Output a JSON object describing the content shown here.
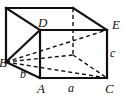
{
  "figure": {
    "type": "geometry-diagram",
    "shape_name": "rectangular-box",
    "width": 125,
    "height": 101,
    "background_color": "#ffffff",
    "stroke_color": "#111111",
    "solid_edge_width": 2.2,
    "hidden_edge_width": 1.4,
    "hidden_edge_dash": "4 3"
  },
  "vertices": {
    "A": {
      "label": "A",
      "x": 40,
      "y": 78,
      "label_x": 37,
      "label_y": 82,
      "hidden": false
    },
    "B": {
      "label": "B",
      "x": 6,
      "y": 62,
      "label_x": -1,
      "label_y": 56,
      "hidden": false
    },
    "C": {
      "label": "C",
      "x": 107,
      "y": 78,
      "label_x": 105,
      "label_y": 82,
      "hidden": false
    },
    "D": {
      "label": "D",
      "x": 40,
      "y": 30,
      "label_x": 38,
      "label_y": 16,
      "hidden": false
    },
    "E": {
      "label": "E",
      "x": 107,
      "y": 30,
      "label_x": 112,
      "label_y": 18,
      "hidden": false
    },
    "F_back_top_left": {
      "label": "",
      "x": 6,
      "y": 8,
      "hidden": false
    },
    "G_back_top_right": {
      "label": "",
      "x": 73,
      "y": 8,
      "hidden": false
    },
    "H_back_bottom_right": {
      "label": "",
      "x": 73,
      "y": 55,
      "hidden": true
    }
  },
  "edge_labels": {
    "a": {
      "label": "a",
      "edge": "A-C",
      "label_x": 68,
      "label_y": 82
    },
    "b": {
      "label": "b",
      "edge": "B-A",
      "label_x": 20,
      "label_y": 68
    },
    "c": {
      "label": "c",
      "edge": "C-E",
      "label_x": 110,
      "label_y": 47
    }
  },
  "solid_edges": [
    {
      "name": "edge-A-C",
      "x1": 40,
      "y1": 78,
      "x2": 107,
      "y2": 78
    },
    {
      "name": "edge-A-D",
      "x1": 40,
      "y1": 78,
      "x2": 40,
      "y2": 30
    },
    {
      "name": "edge-C-E",
      "x1": 107,
      "y1": 78,
      "x2": 107,
      "y2": 30
    },
    {
      "name": "edge-D-E",
      "x1": 40,
      "y1": 30,
      "x2": 107,
      "y2": 30
    },
    {
      "name": "edge-B-A",
      "x1": 6,
      "y1": 62,
      "x2": 40,
      "y2": 78
    },
    {
      "name": "edge-B-D",
      "x1": 6,
      "y1": 62,
      "x2": 40,
      "y2": 30
    },
    {
      "name": "edge-B-backtopleft",
      "x1": 6,
      "y1": 62,
      "x2": 6,
      "y2": 8
    },
    {
      "name": "edge-backtopleft-backtopright",
      "x1": 6,
      "y1": 8,
      "x2": 73,
      "y2": 8
    },
    {
      "name": "edge-backtopleft-D",
      "x1": 6,
      "y1": 8,
      "x2": 40,
      "y2": 30
    },
    {
      "name": "edge-backtopright-E",
      "x1": 73,
      "y1": 8,
      "x2": 107,
      "y2": 30
    }
  ],
  "hidden_edges": [
    {
      "name": "hidden-edge-backtopright-H",
      "x1": 73,
      "y1": 8,
      "x2": 73,
      "y2": 55
    },
    {
      "name": "hidden-edge-B-H",
      "x1": 6,
      "y1": 62,
      "x2": 73,
      "y2": 55
    },
    {
      "name": "hidden-edge-H-C",
      "x1": 73,
      "y1": 55,
      "x2": 107,
      "y2": 78
    }
  ],
  "diagonals": [
    {
      "name": "diagonal-B-E",
      "x1": 6,
      "y1": 62,
      "x2": 107,
      "y2": 30
    },
    {
      "name": "diagonal-B-C",
      "x1": 6,
      "y1": 62,
      "x2": 107,
      "y2": 78
    }
  ]
}
